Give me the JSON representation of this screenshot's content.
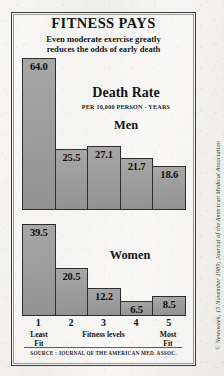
{
  "title": "FITNESS PAYS",
  "subtitle_line1": "Even moderate exercise greatly",
  "subtitle_line2": "reduces the odds of early death",
  "metric_label": "Death Rate",
  "metric_units": "PER 10,000 PERSON - YEARS",
  "men_label": "Men",
  "women_label": "Women",
  "axis": {
    "numbers": [
      "1",
      "2",
      "3",
      "4",
      "5"
    ],
    "least_fit_line1": "Least",
    "least_fit_line2": "Fit",
    "middle_caption": "Fitness levels",
    "most_fit_line1": "Most",
    "most_fit_line2": "Fit"
  },
  "source": "SOURCE : JOURNAL OF THE AMERICAN MED. ASSOC.",
  "credit": "© Newsweek, 15 November 1989; Journal of the American Medical Association",
  "colors": {
    "bar_fill": "#9d9d9d",
    "bar_stroke": "#2e2e2e",
    "frame": "#3a3a3a",
    "paper": "#f4f3f1"
  },
  "chart_data": [
    {
      "type": "bar",
      "title": "Death Rate — Men",
      "xlabel": "Fitness levels",
      "ylabel": "Death rate per 10,000 person-years",
      "categories": [
        "1",
        "2",
        "3",
        "4",
        "5"
      ],
      "values": [
        64.0,
        25.5,
        27.1,
        21.7,
        18.6
      ],
      "ylim": [
        0,
        64.0
      ],
      "grid": false,
      "legend": "none"
    },
    {
      "type": "bar",
      "title": "Death Rate — Women",
      "xlabel": "Fitness levels",
      "ylabel": "Death rate per 10,000 person-years",
      "categories": [
        "1",
        "2",
        "3",
        "4",
        "5"
      ],
      "values": [
        39.5,
        20.5,
        12.2,
        6.5,
        8.5
      ],
      "ylim": [
        0,
        39.5
      ],
      "grid": false,
      "legend": "none"
    }
  ]
}
